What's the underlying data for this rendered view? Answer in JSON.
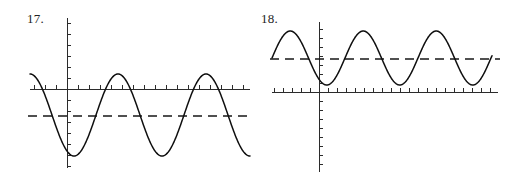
{
  "sheet": {
    "background": "#ffffff",
    "width": 510,
    "height": 186,
    "curve_color": "#0f0f0f",
    "axis_color": "#2b2b2b",
    "dashed_color": "#171717"
  },
  "panels": [
    {
      "label": "17.",
      "name": "figure-17",
      "axes": {
        "y_axis_x": 67,
        "y_axis_top": 18,
        "y_axis_bottom": 168,
        "x_axis_y": 89,
        "x_axis_left": 30,
        "x_axis_right": 250,
        "tick_spacing": 11,
        "tick_length": 4
      },
      "dashed_line": {
        "y": 116,
        "x_start": 28,
        "x_end": 252
      },
      "curve": {
        "amplitude_px": 41,
        "midline_y": 115,
        "period_px": 88,
        "phase_px": 30,
        "x_start": 30,
        "x_end": 250,
        "peak_y": 74,
        "trough_y": 156
      }
    },
    {
      "label": "18.",
      "name": "figure-18",
      "axes": {
        "y_axis_x": 64,
        "y_axis_top": 22,
        "y_axis_bottom": 172,
        "x_axis_y": 92,
        "x_axis_left": 17,
        "x_axis_right": 243,
        "tick_spacing": 9,
        "tick_length": 4
      },
      "dashed_line": {
        "y": 59,
        "x_start": 15,
        "x_end": 245
      },
      "curve": {
        "amplitude_px": 27,
        "midline_y": 58,
        "period_px": 73,
        "phase_px": 17,
        "x_start": 17,
        "x_end": 237,
        "peak_y": 31,
        "trough_y": 85
      }
    }
  ],
  "chart_data": {
    "type": "line",
    "title": "",
    "xlabel": "",
    "ylabel": "",
    "charts": [
      {
        "name": "17.",
        "type": "line",
        "grid": false,
        "legend": false,
        "x_axis": {
          "visible": true,
          "ticks": "unlabeled",
          "tick_count": 21
        },
        "y_axis": {
          "visible": true,
          "ticks": "unlabeled",
          "tick_count": 14
        },
        "series": [
          {
            "name": "sinusoid",
            "style": "solid",
            "form": "y = A*cos(2*pi*(x - phase)/period) + D",
            "amplitude": 41,
            "period": 88,
            "midline": -26,
            "cycles_shown": 2.5,
            "starts_at": "local maximum at left edge"
          },
          {
            "name": "midline",
            "style": "dashed",
            "form": "y = D",
            "value": -26
          }
        ]
      },
      {
        "name": "18.",
        "type": "line",
        "grid": false,
        "legend": false,
        "x_axis": {
          "visible": true,
          "ticks": "unlabeled",
          "tick_count": 25
        },
        "y_axis": {
          "visible": true,
          "ticks": "unlabeled",
          "tick_count": 15
        },
        "series": [
          {
            "name": "sinusoid",
            "style": "solid",
            "form": "y = A*sin(2*pi*(x - phase)/period) + D",
            "amplitude": 27,
            "period": 73,
            "midline": 34,
            "cycles_shown": 3.0,
            "starts_at": "midline rising at left edge"
          },
          {
            "name": "midline",
            "style": "dashed",
            "form": "y = D",
            "value": 34
          }
        ]
      }
    ]
  }
}
